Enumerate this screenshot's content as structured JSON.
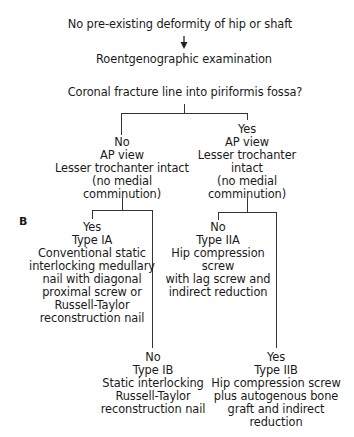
{
  "figure_label": "B",
  "nodes": {
    "start": "No pre-existing deformity of hip or shaft",
    "exam": "Roentgenographic examination",
    "question": "Coronal fracture line into piriformis fossa?",
    "no_branch": "No\nAP view\nLesser trochanter intact\n(no medial comminution)",
    "yes_branch": "Yes\nAP view\nLesser trochanter intact\n(no medial\ncomminution)",
    "type_ia": "Yes\nType IA\nConventional static\ninterlocking medullary\nnail with diagonal\nproximal screw or\nRussell-Taylor\nreconstruction nail",
    "type_ib": "No\nType IB\nStatic interlocking\nRussell-Taylor\nreconstruction nail",
    "type_iia": "No\nType IIA\nHip compression\nscrew\nwith lag screw and\nindirect reduction",
    "type_iib": "Yes\nType IIB\nHip compression screw\nplus autogenous bone\ngraft and indirect\nreduction"
  },
  "icons": {
    "arrow": "down-arrow"
  }
}
